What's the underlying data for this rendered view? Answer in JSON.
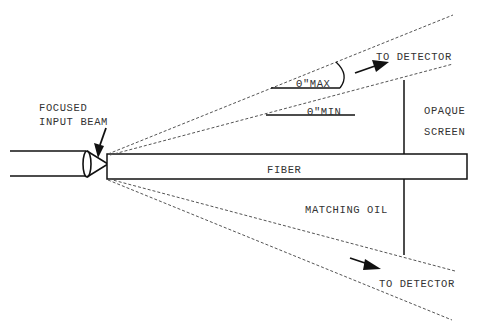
{
  "diagram": {
    "labels": {
      "focused_input_beam_line1": "FOCUSED",
      "focused_input_beam_line2": "INPUT BEAM",
      "to_detector_top": "TO DETECTOR",
      "theta_max": "Θ\"MAX",
      "theta_min": "Θ\"MIN",
      "opaque_screen_line1": "OPAQUE",
      "opaque_screen_line2": "SCREEN",
      "fiber": "FIBER",
      "matching_oil": "MATCHING OIL",
      "to_detector_bottom": "TO DETECTOR"
    },
    "colors": {
      "stroke": "#111111",
      "text": "#333333",
      "background": "#ffffff"
    }
  }
}
